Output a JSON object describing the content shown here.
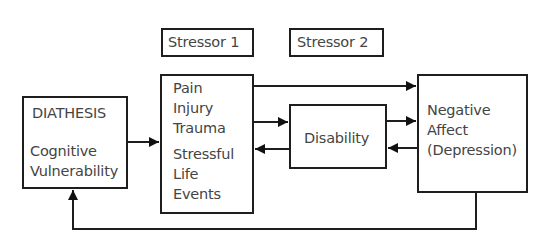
{
  "diagram": {
    "labels": {
      "stressor1": "Stressor 1",
      "stressor2": "Stressor 2"
    },
    "nodes": {
      "diathesis": {
        "title": "DIATHESIS",
        "lines": [
          "Cognitive",
          "Vulnerability"
        ]
      },
      "stressors": {
        "lines_top": [
          "Pain",
          "Injury",
          "Trauma"
        ],
        "lines_bottom": [
          "Stressful",
          "Life",
          "Events"
        ]
      },
      "disability": {
        "label": "Disability"
      },
      "negative_affect": {
        "lines": [
          "Negative",
          "Affect",
          "(Depression)"
        ]
      }
    },
    "edges": [
      {
        "from": "diathesis",
        "to": "stressors"
      },
      {
        "from": "stressors",
        "to": "negative_affect"
      },
      {
        "from": "stressors",
        "to": "disability"
      },
      {
        "from": "disability",
        "to": "stressors"
      },
      {
        "from": "disability",
        "to": "negative_affect"
      },
      {
        "from": "negative_affect",
        "to": "disability"
      },
      {
        "from": "negative_affect",
        "to": "diathesis"
      }
    ]
  }
}
